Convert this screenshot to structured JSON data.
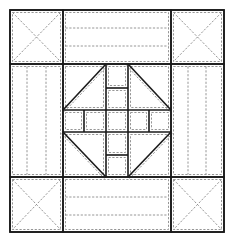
{
  "diagram": {
    "canvas": {
      "width": 229,
      "height": 239
    },
    "colors": {
      "line": "#1a1a1a",
      "seam": "#8a8a8a",
      "background": "#ffffff"
    },
    "outer": {
      "x1": 10,
      "y1": 10,
      "x2": 224,
      "y2": 232
    },
    "grid": {
      "cols": [
        10,
        63,
        171,
        224
      ],
      "rows": [
        10,
        64,
        177,
        232
      ]
    },
    "corner_squares": [
      {
        "name": "top-left",
        "x1": 10,
        "y1": 10,
        "x2": 63,
        "y2": 64
      },
      {
        "name": "top-right",
        "x1": 171,
        "y1": 10,
        "x2": 224,
        "y2": 64
      },
      {
        "name": "bottom-left",
        "x1": 10,
        "y1": 177,
        "x2": 63,
        "y2": 232
      },
      {
        "name": "bottom-right",
        "x1": 171,
        "y1": 177,
        "x2": 224,
        "y2": 232
      }
    ],
    "strips": [
      {
        "name": "top",
        "orientation": "horizontal",
        "x1": 63,
        "y1": 10,
        "x2": 171,
        "y2": 64,
        "quilt_lines": [
          28,
          46
        ]
      },
      {
        "name": "bottom",
        "orientation": "horizontal",
        "x1": 63,
        "y1": 177,
        "x2": 171,
        "y2": 232,
        "quilt_lines": [
          197,
          215
        ]
      },
      {
        "name": "left",
        "orientation": "vertical",
        "x1": 10,
        "y1": 64,
        "x2": 63,
        "y2": 177,
        "quilt_lines": [
          27,
          46
        ]
      },
      {
        "name": "right",
        "orientation": "vertical",
        "x1": 171,
        "y1": 64,
        "x2": 224,
        "y2": 177,
        "quilt_lines": [
          188,
          206
        ]
      }
    ],
    "center": {
      "x1": 63,
      "y1": 64,
      "x2": 171,
      "y2": 177,
      "column": {
        "x1": 106,
        "x2": 128
      },
      "band": {
        "y1": 110,
        "y2": 132
      },
      "column_dividers": [
        88,
        155
      ],
      "band_dividers": [
        84,
        149
      ],
      "diagonals": [
        {
          "x1": 63,
          "y1": 110,
          "x2": 106,
          "y2": 64
        },
        {
          "x1": 128,
          "y1": 64,
          "x2": 171,
          "y2": 110
        },
        {
          "x1": 63,
          "y1": 132,
          "x2": 106,
          "y2": 177
        },
        {
          "x1": 128,
          "y1": 177,
          "x2": 171,
          "y2": 132
        }
      ]
    }
  }
}
